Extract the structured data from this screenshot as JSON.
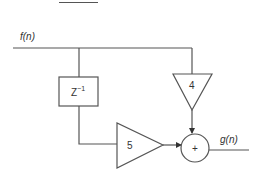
{
  "diagram": {
    "type": "signal-flow block diagram",
    "input_label": "f(n)",
    "output_label": "g(n)",
    "delay_block": {
      "label": "Z",
      "superscript": "−1"
    },
    "gain_top": {
      "label": "4"
    },
    "gain_bottom": {
      "label": "5"
    },
    "summer": {
      "label": "+"
    },
    "colors": {
      "stroke": "#555555",
      "text": "#333333",
      "background": "#ffffff"
    }
  }
}
